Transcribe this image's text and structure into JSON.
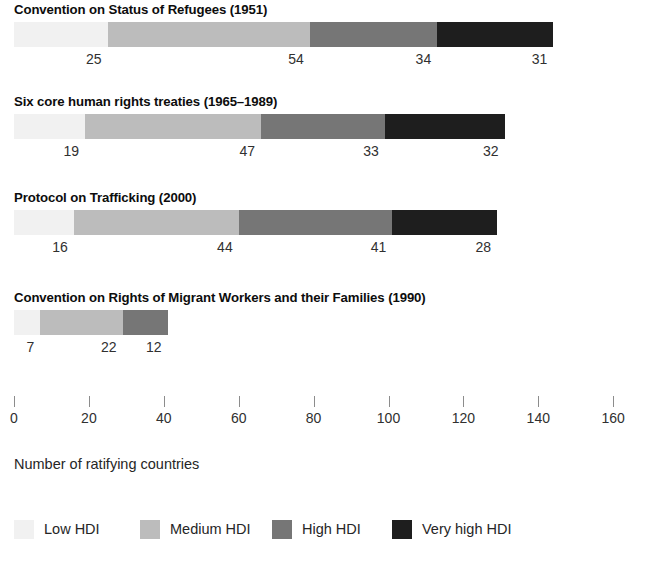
{
  "chart_data": {
    "type": "bar",
    "orientation": "horizontal",
    "stacked": true,
    "title": "",
    "xlabel": "Number of ratifying countries",
    "ylabel": "",
    "xlim": [
      0,
      160
    ],
    "xticks": [
      0,
      20,
      40,
      60,
      80,
      100,
      120,
      140,
      160
    ],
    "grid": false,
    "legend_position": "bottom",
    "series": [
      {
        "name": "Low HDI",
        "color": "#f1f1f1",
        "values": [
          25,
          19,
          16,
          7
        ]
      },
      {
        "name": "Medium HDI",
        "color": "#bcbcbc",
        "values": [
          54,
          47,
          44,
          22
        ]
      },
      {
        "name": "High HDI",
        "color": "#767676",
        "values": [
          34,
          33,
          41,
          12
        ]
      },
      {
        "name": "Very high HDI",
        "color": "#1e1e1e",
        "values": [
          31,
          32,
          28,
          null
        ]
      }
    ],
    "categories": [
      "Convention on Status of Refugees (1951)",
      "Six core human rights treaties (1965–1989)",
      "Protocol on Trafficking (2000)",
      "Convention on Rights of Migrant Workers and their Families (1990)"
    ],
    "totals": [
      144,
      131,
      129,
      41
    ]
  },
  "groups": [
    {
      "title": "Convention on Status of Refugees (1951)",
      "segments": [
        {
          "series": "Low HDI",
          "value": 25,
          "label": "25",
          "color": "#f1f1f1"
        },
        {
          "series": "Medium HDI",
          "value": 54,
          "label": "54",
          "color": "#bcbcbc"
        },
        {
          "series": "High HDI",
          "value": 34,
          "label": "34",
          "color": "#767676"
        },
        {
          "series": "Very high HDI",
          "value": 31,
          "label": "31",
          "color": "#1e1e1e"
        }
      ]
    },
    {
      "title": "Six core human rights treaties (1965–1989)",
      "segments": [
        {
          "series": "Low HDI",
          "value": 19,
          "label": "19",
          "color": "#f1f1f1"
        },
        {
          "series": "Medium HDI",
          "value": 47,
          "label": "47",
          "color": "#bcbcbc"
        },
        {
          "series": "High HDI",
          "value": 33,
          "label": "33",
          "color": "#767676"
        },
        {
          "series": "Very high HDI",
          "value": 32,
          "label": "32",
          "color": "#1e1e1e"
        }
      ]
    },
    {
      "title": "Protocol on Trafficking (2000)",
      "segments": [
        {
          "series": "Low HDI",
          "value": 16,
          "label": "16",
          "color": "#f1f1f1"
        },
        {
          "series": "Medium HDI",
          "value": 44,
          "label": "44",
          "color": "#bcbcbc"
        },
        {
          "series": "High HDI",
          "value": 41,
          "label": "41",
          "color": "#767676"
        },
        {
          "series": "Very high HDI",
          "value": 28,
          "label": "28",
          "color": "#1e1e1e"
        }
      ]
    },
    {
      "title": "Convention on Rights of Migrant Workers and their Families (1990)",
      "segments": [
        {
          "series": "Low HDI",
          "value": 7,
          "label": "7",
          "color": "#f1f1f1"
        },
        {
          "series": "Medium HDI",
          "value": 22,
          "label": "22",
          "color": "#bcbcbc"
        },
        {
          "series": "High HDI",
          "value": 12,
          "label": "12",
          "color": "#767676"
        }
      ]
    }
  ],
  "axis": {
    "ticks": [
      {
        "value": 0,
        "label": "0"
      },
      {
        "value": 20,
        "label": "20"
      },
      {
        "value": 40,
        "label": "40"
      },
      {
        "value": 60,
        "label": "60"
      },
      {
        "value": 80,
        "label": "80"
      },
      {
        "value": 100,
        "label": "100"
      },
      {
        "value": 120,
        "label": "120"
      },
      {
        "value": 140,
        "label": "140"
      },
      {
        "value": 160,
        "label": "160"
      }
    ],
    "title": "Number of ratifying countries"
  },
  "legend": {
    "items": [
      {
        "label": "Low HDI",
        "color": "#f1f1f1"
      },
      {
        "label": "Medium HDI",
        "color": "#bcbcbc"
      },
      {
        "label": "High HDI",
        "color": "#767676"
      },
      {
        "label": "Very high HDI",
        "color": "#1e1e1e"
      }
    ]
  },
  "scale": {
    "origin_px": 14,
    "px_per_unit": 3.745
  }
}
